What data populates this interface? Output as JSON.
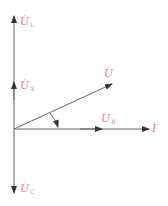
{
  "diagram": {
    "type": "phasor-diagram",
    "colors": {
      "axis": "#555555",
      "label": "#d9809f",
      "background": "#ffffff"
    },
    "origin": {
      "x": 14,
      "y": 129
    },
    "phasors": [
      {
        "id": "UL",
        "symbol": "U",
        "subscript": "L",
        "tip": {
          "x": 14,
          "y": 22
        }
      },
      {
        "id": "UX",
        "symbol": "U",
        "subscript": "X",
        "tip": {
          "x": 14,
          "y": 85
        }
      },
      {
        "id": "UC",
        "symbol": "U",
        "subscript": "C",
        "tip": {
          "x": 14,
          "y": 192
        }
      },
      {
        "id": "UR",
        "symbol": "U",
        "subscript": "R",
        "tip": {
          "x": 100,
          "y": 129
        }
      },
      {
        "id": "U",
        "symbol": "U",
        "subscript": "",
        "tip": {
          "x": 110,
          "y": 84
        }
      },
      {
        "id": "I",
        "symbol": "I",
        "subscript": "",
        "tip": {
          "x": 148,
          "y": 129
        }
      }
    ],
    "labels": {
      "UL": {
        "symbol": "U",
        "sub": "L"
      },
      "UX": {
        "symbol": "U",
        "sub": "X"
      },
      "UC": {
        "symbol": "U",
        "sub": "C"
      },
      "UR": {
        "symbol": "U",
        "sub": "R"
      },
      "U": {
        "symbol": "U",
        "sub": ""
      },
      "I": {
        "symbol": "I",
        "sub": ""
      },
      "dot": "·"
    },
    "angle_arc": {
      "between": [
        "U",
        "I"
      ],
      "has_arrow": true
    }
  }
}
